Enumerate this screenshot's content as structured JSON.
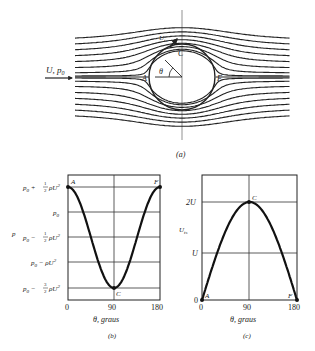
{
  "figure": {
    "panel_a": {
      "caption": "(a)",
      "inflow_label": "U, p",
      "inflow_sub": "0",
      "point_labels": {
        "A": "A",
        "C": "C",
        "F": "F"
      },
      "theta_label": "θ",
      "surface_velocity_label": "U",
      "surface_velocity_sub": "ts"
    },
    "panel_b": {
      "caption": "(b)",
      "ylabel": "p",
      "xlabel": "θ, graus",
      "xticks": [
        "0",
        "90",
        "180"
      ],
      "yticks": [
        "p0 + 1/2 ρU²",
        "p0",
        "p0 − 1/2 ρU²",
        "p0 − ρU²",
        "p0 − 3/2 ρU²"
      ],
      "point_labels": {
        "A": "A",
        "C": "C",
        "F": "F"
      }
    },
    "panel_c": {
      "caption": "(c)",
      "ylabel": "U",
      "ylabel_sub": "ts",
      "xlabel": "θ, graus",
      "xticks": [
        "0",
        "90",
        "180"
      ],
      "yticks": [
        "0",
        "U",
        "2U"
      ],
      "point_labels": {
        "A": "A",
        "C": "C",
        "F": "F"
      }
    }
  },
  "chart_data": [
    {
      "type": "line",
      "title": "(b) Surface pressure on cylinder",
      "xlabel": "θ, graus",
      "ylabel": "p",
      "x": [
        0,
        30,
        45,
        60,
        90,
        120,
        135,
        150,
        180
      ],
      "values_label": "p relative: p0 + (1/2)ρU²(1 − 4sin²θ), in units of ρU²",
      "values": [
        0.5,
        0.0,
        -0.5,
        -1.0,
        -1.5,
        -1.0,
        -0.5,
        0.0,
        0.5
      ],
      "xlim": [
        0,
        180
      ],
      "ylim": [
        -1.5,
        0.5
      ],
      "grid": true
    },
    {
      "type": "line",
      "title": "(c) Surface velocity on cylinder",
      "xlabel": "θ, graus",
      "ylabel": "U_ts",
      "x": [
        0,
        30,
        60,
        90,
        120,
        150,
        180
      ],
      "values_label": "U_ts = 2U sinθ, in units of U",
      "values": [
        0,
        1.0,
        1.732,
        2.0,
        1.732,
        1.0,
        0
      ],
      "xlim": [
        0,
        180
      ],
      "ylim": [
        0,
        2.6
      ],
      "grid": true
    }
  ]
}
